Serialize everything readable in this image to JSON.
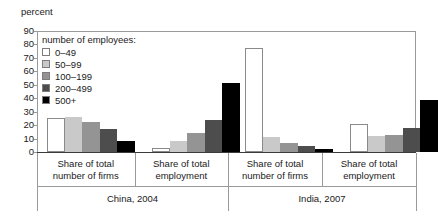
{
  "axis_title": "percent",
  "legend": {
    "title": "number of employees:",
    "items": [
      {
        "label": "0–49",
        "color": "#ffffff"
      },
      {
        "label": "50–99",
        "color": "#c9c9c9"
      },
      {
        "label": "100–199",
        "color": "#949494"
      },
      {
        "label": "200–499",
        "color": "#4d4d4d"
      },
      {
        "label": "500+",
        "color": "#000000"
      }
    ]
  },
  "yaxis": {
    "ticks": [
      "0",
      "10",
      "20",
      "30",
      "40",
      "50",
      "60",
      "70",
      "80",
      "90"
    ],
    "min": 0,
    "max": 90
  },
  "groups": [
    {
      "label_line1": "Share of total",
      "label_line2": "number of firms"
    },
    {
      "label_line1": "Share of total",
      "label_line2": "employment"
    },
    {
      "label_line1": "Share of total",
      "label_line2": "number of firms"
    },
    {
      "label_line1": "Share of total",
      "label_line2": "employment"
    }
  ],
  "countries": [
    {
      "label": "China, 2004"
    },
    {
      "label": "India, 2007"
    }
  ],
  "chart_data": {
    "type": "bar",
    "title": "",
    "subtitle": "",
    "xlabel": "",
    "ylabel": "percent",
    "ylim": [
      0,
      90
    ],
    "ytick_step": 10,
    "grid": false,
    "legend_position": "inside-top-left",
    "legend_title": "number of employees:",
    "categories": [
      "China, 2004 – Share of total number of firms",
      "China, 2004 – Share of total employment",
      "India, 2007 – Share of total number of firms",
      "India, 2007 – Share of total employment"
    ],
    "series": [
      {
        "name": "0–49",
        "color": "#ffffff",
        "values": [
          25.0,
          3.0,
          77.0,
          20.5
        ]
      },
      {
        "name": "50–99",
        "color": "#c9c9c9",
        "values": [
          26.0,
          8.0,
          11.0,
          12.0
        ]
      },
      {
        "name": "100–199",
        "color": "#949494",
        "values": [
          22.5,
          14.0,
          6.5,
          13.0
        ]
      },
      {
        "name": "200–499",
        "color": "#4d4d4d",
        "values": [
          17.0,
          23.5,
          4.5,
          17.5
        ]
      },
      {
        "name": "500+",
        "color": "#000000",
        "values": [
          8.5,
          51.0,
          2.5,
          38.5
        ]
      }
    ]
  }
}
